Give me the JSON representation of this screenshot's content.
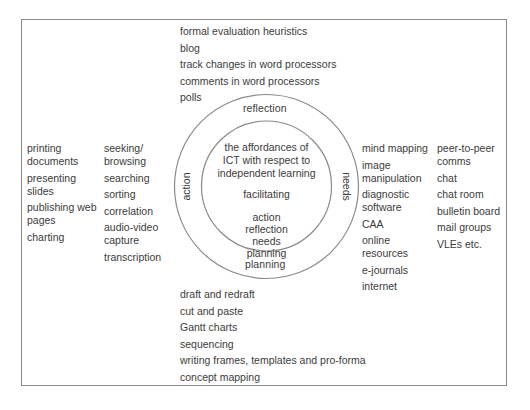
{
  "diagram": {
    "top_list": {
      "items": [
        "formal evaluation heuristics",
        "blog",
        "track changes in word processors",
        "comments in word processors",
        "polls"
      ]
    },
    "bottom_list": {
      "items": [
        "draft and redraft",
        "cut and paste",
        "Gantt charts",
        "sequencing",
        "writing frames, templates and pro-forma",
        "concept mapping"
      ]
    },
    "left_outer_column": {
      "items": [
        [
          "printing",
          "documents"
        ],
        [
          "presenting",
          "slides"
        ],
        [
          "publishing web",
          "pages"
        ],
        [
          "charting"
        ]
      ]
    },
    "left_inner_column": {
      "items": [
        [
          "seeking/",
          "browsing"
        ],
        [
          "searching"
        ],
        [
          "sorting"
        ],
        [
          "correlation"
        ],
        [
          "audio-video",
          "capture"
        ],
        [
          "transcription"
        ]
      ]
    },
    "right_inner_column": {
      "items": [
        [
          "mind mapping"
        ],
        [
          "image",
          "manipulation"
        ],
        [
          "diagnostic",
          "software"
        ],
        [
          "CAA"
        ],
        [
          "online",
          "resources"
        ],
        [
          "e-journals"
        ],
        [
          "internet"
        ]
      ]
    },
    "right_outer_column": {
      "items": [
        [
          "peer-to-peer",
          "comms"
        ],
        [
          "chat"
        ],
        [
          "chat room"
        ],
        [
          "bulletin board"
        ],
        [
          "mail groups"
        ],
        [
          "VLEs etc."
        ]
      ]
    },
    "outer_ring_labels": {
      "top": "reflection",
      "bottom": "planning",
      "left": "action",
      "right": "needs"
    },
    "inner_circle": {
      "title_lines": [
        "the affordances of",
        "ICT with respect to",
        "independent learning"
      ],
      "subtitle": "facilitating",
      "stages": [
        "action",
        "reflection",
        "needs",
        "planning"
      ]
    },
    "colors": {
      "text": "#3b3b3b",
      "lines": "#8a8a8a",
      "background": "#ffffff"
    }
  }
}
